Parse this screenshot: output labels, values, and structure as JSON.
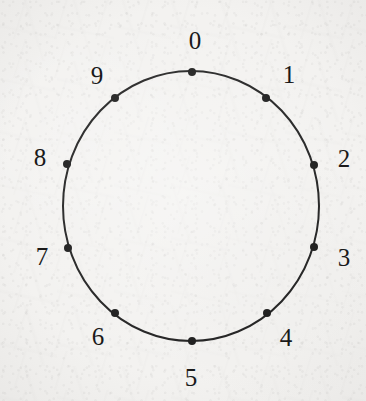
{
  "figure": {
    "background_color": "#f3f2f0",
    "ink_color": "#1a1a1a"
  },
  "chart_data": {
    "type": "scatter",
    "title": "",
    "xlabel": "",
    "ylabel": "",
    "grid": false,
    "legend": null,
    "circle": {
      "center_x": 191,
      "center_y": 206,
      "radius_x": 128,
      "radius_y": 135,
      "stroke_width": 2,
      "stroke_color": "#1a1a1a",
      "fill": "none"
    },
    "point_style": {
      "shape": "filled-circle",
      "radius": 4,
      "color": "#141414"
    },
    "categories": [
      "0",
      "1",
      "2",
      "3",
      "4",
      "5",
      "6",
      "7",
      "8",
      "9"
    ],
    "values": [
      0,
      36,
      72,
      108,
      144,
      180,
      216,
      252,
      288,
      324
    ],
    "points": [
      {
        "label": "0",
        "angle_deg": 0,
        "px": 192,
        "py": 72,
        "lx": 195,
        "ly": 40
      },
      {
        "label": "1",
        "angle_deg": 36,
        "px": 266,
        "py": 98,
        "lx": 289,
        "ly": 74
      },
      {
        "label": "2",
        "angle_deg": 72,
        "px": 314,
        "py": 165,
        "lx": 344,
        "ly": 158
      },
      {
        "label": "3",
        "angle_deg": 108,
        "px": 314,
        "py": 247,
        "lx": 344,
        "ly": 257
      },
      {
        "label": "4",
        "angle_deg": 144,
        "px": 267,
        "py": 313,
        "lx": 286,
        "ly": 337
      },
      {
        "label": "5",
        "angle_deg": 180,
        "px": 192,
        "py": 341,
        "lx": 191,
        "ly": 377
      },
      {
        "label": "6",
        "angle_deg": 216,
        "px": 115,
        "py": 313,
        "lx": 98,
        "ly": 336
      },
      {
        "label": "7",
        "angle_deg": 252,
        "px": 68,
        "py": 248,
        "lx": 42,
        "ly": 256
      },
      {
        "label": "8",
        "angle_deg": 288,
        "px": 67,
        "py": 164,
        "lx": 40,
        "ly": 157
      },
      {
        "label": "9",
        "angle_deg": 324,
        "px": 115,
        "py": 98,
        "lx": 97,
        "ly": 75
      }
    ]
  }
}
